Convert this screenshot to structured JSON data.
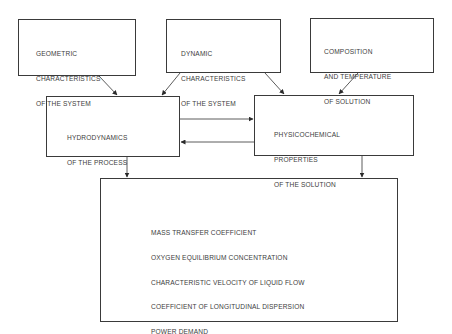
{
  "diagram": {
    "type": "flowchart",
    "nodes": [
      {
        "id": "geometric",
        "lines": [
          "GEOMETRIC",
          "CHARACTERISTICS",
          "OF THE SYSTEM"
        ]
      },
      {
        "id": "dynamic",
        "lines": [
          "DYNAMIC",
          "CHARACTERISTICS",
          "OF THE SYSTEM"
        ]
      },
      {
        "id": "composition",
        "lines": [
          "COMPOSITION",
          "AND TEMPERATURE",
          "OF SOLUTION"
        ]
      },
      {
        "id": "hydrodynamics",
        "lines": [
          "HYDRODYNAMICS",
          "OF THE PROCESS"
        ]
      },
      {
        "id": "physicochemical",
        "lines": [
          "PHYSICOCHEMICAL",
          "PROPERTIES",
          "OF THE SOLUTION"
        ]
      },
      {
        "id": "outputs",
        "lines": [
          "MASS TRANSFER COEFFICIENT",
          "OXYGEN EQUILIBRIUM CONCENTRATION",
          "CHARACTERISTIC VELOCITY OF LIQUID FLOW",
          "COEFFICIENT OF LONGITUDINAL DISPERSION",
          "POWER DEMAND"
        ]
      }
    ],
    "edges": [
      {
        "from": "geometric",
        "to": "hydrodynamics"
      },
      {
        "from": "dynamic",
        "to": "hydrodynamics"
      },
      {
        "from": "dynamic",
        "to": "physicochemical"
      },
      {
        "from": "composition",
        "to": "physicochemical"
      },
      {
        "from": "hydrodynamics",
        "to": "physicochemical"
      },
      {
        "from": "physicochemical",
        "to": "hydrodynamics"
      },
      {
        "from": "hydrodynamics",
        "to": "outputs"
      },
      {
        "from": "physicochemical",
        "to": "outputs"
      }
    ],
    "colors": {
      "line": "#3a3a3a",
      "text": "#3c3c3c",
      "background": "#ffffff"
    }
  }
}
